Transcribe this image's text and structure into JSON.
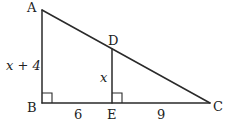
{
  "diagram": {
    "type": "geometry-similar-triangles",
    "vertices": [
      "A",
      "B",
      "C",
      "D",
      "E"
    ],
    "segments": [
      "AB",
      "BE",
      "EC",
      "AC",
      "DE"
    ],
    "right_angles": [
      "B",
      "E"
    ],
    "labels": {
      "A": "A",
      "B": "B",
      "C": "C",
      "D": "D",
      "E": "E"
    },
    "measures": {
      "AB": "x + 4",
      "DE": "x",
      "BE": "6",
      "EC": "9"
    },
    "line_color": "#2a2a2a"
  }
}
